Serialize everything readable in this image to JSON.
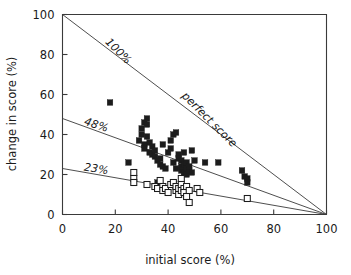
{
  "chart_data": {
    "type": "scatter",
    "title": "",
    "xlabel": "initial score (%)",
    "ylabel": "change  in score (%)",
    "xlim": [
      0,
      100
    ],
    "ylim": [
      0,
      100
    ],
    "xticks": [
      0,
      20,
      40,
      60,
      80,
      100
    ],
    "yticks": [
      0,
      20,
      40,
      60,
      80,
      100
    ],
    "xticklabels": [
      "0",
      "20",
      "40",
      "60",
      "80",
      "100"
    ],
    "yticklabels": [
      "0",
      "20",
      "40",
      "60",
      "80",
      "100"
    ],
    "grid": false,
    "legend": "none",
    "annotations": [
      {
        "text": "100%",
        "x": 16,
        "y": 86,
        "rotation": 45,
        "italic": true
      },
      {
        "text": "perfect score",
        "x": 45,
        "y": 59,
        "rotation": 45,
        "italic": true
      },
      {
        "text": "48%",
        "x": 8,
        "y": 45,
        "rotation": 18,
        "italic": true
      },
      {
        "text": "23%",
        "x": 8,
        "y": 22,
        "rotation": 9,
        "italic": true
      }
    ],
    "reference_lines": [
      {
        "name": "100%",
        "from": [
          0,
          100
        ],
        "to": [
          100,
          0
        ]
      },
      {
        "name": "48%",
        "from": [
          0,
          48
        ],
        "to": [
          100,
          0
        ]
      },
      {
        "name": "23%",
        "from": [
          0,
          23
        ],
        "to": [
          100,
          0
        ]
      }
    ],
    "series": [
      {
        "name": "filled squares",
        "marker": "filled-square",
        "color": "#1c1c1c",
        "points": [
          [
            18,
            56
          ],
          [
            25,
            26
          ],
          [
            29,
            37
          ],
          [
            30,
            43
          ],
          [
            30,
            40
          ],
          [
            31,
            35
          ],
          [
            31,
            46
          ],
          [
            31,
            33
          ],
          [
            32,
            45
          ],
          [
            32,
            48
          ],
          [
            32,
            39
          ],
          [
            33,
            36
          ],
          [
            33,
            31
          ],
          [
            34,
            30
          ],
          [
            34,
            34
          ],
          [
            35,
            29
          ],
          [
            35,
            32
          ],
          [
            36,
            27
          ],
          [
            36,
            16
          ],
          [
            37,
            28
          ],
          [
            37,
            25
          ],
          [
            38,
            24
          ],
          [
            38,
            35
          ],
          [
            39,
            23
          ],
          [
            40,
            31
          ],
          [
            41,
            37
          ],
          [
            41,
            33
          ],
          [
            42,
            40
          ],
          [
            42,
            26
          ],
          [
            43,
            41
          ],
          [
            43,
            23
          ],
          [
            44,
            30
          ],
          [
            44,
            28
          ],
          [
            45,
            27
          ],
          [
            45,
            22
          ],
          [
            45,
            24
          ],
          [
            46,
            25
          ],
          [
            46,
            21
          ],
          [
            46,
            31
          ],
          [
            47,
            23
          ],
          [
            47,
            20
          ],
          [
            47,
            26
          ],
          [
            48,
            22
          ],
          [
            48,
            24
          ],
          [
            49,
            32
          ],
          [
            49,
            21
          ],
          [
            50,
            27
          ],
          [
            54,
            26
          ],
          [
            59,
            26
          ],
          [
            68,
            22
          ],
          [
            69,
            19
          ],
          [
            70,
            18
          ],
          [
            70,
            16
          ]
        ]
      },
      {
        "name": "open squares",
        "marker": "open-square",
        "color": "#ffffff",
        "points": [
          [
            27,
            21
          ],
          [
            27,
            18
          ],
          [
            27,
            16
          ],
          [
            32,
            15
          ],
          [
            35,
            14
          ],
          [
            36,
            13
          ],
          [
            37,
            17
          ],
          [
            38,
            14
          ],
          [
            38,
            12
          ],
          [
            39,
            13
          ],
          [
            40,
            11
          ],
          [
            41,
            15
          ],
          [
            42,
            16
          ],
          [
            43,
            12
          ],
          [
            43,
            14
          ],
          [
            44,
            13
          ],
          [
            44,
            10
          ],
          [
            45,
            18
          ],
          [
            45,
            15
          ],
          [
            45,
            12
          ],
          [
            46,
            13
          ],
          [
            46,
            11
          ],
          [
            47,
            14
          ],
          [
            47,
            9
          ],
          [
            48,
            6
          ],
          [
            48,
            12
          ],
          [
            51,
            13
          ],
          [
            52,
            11
          ],
          [
            70,
            8
          ]
        ]
      }
    ]
  }
}
